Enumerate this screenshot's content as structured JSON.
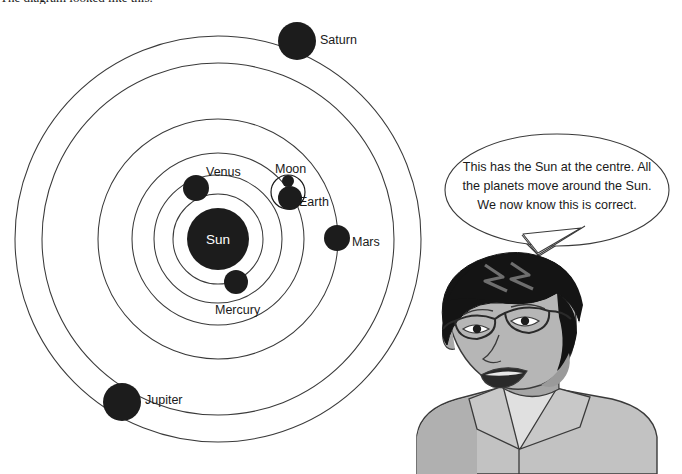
{
  "caption": {
    "text": "The diagram looked like this."
  },
  "diagram": {
    "name": "heliocentric-solar-system-diagram",
    "center_label": "Sun",
    "bodies": [
      {
        "name": "Sun",
        "label": "Sun",
        "cx": 218,
        "cy": 239,
        "r": 31,
        "label_x": 218,
        "label_y": 244,
        "label_anchor": "middle",
        "label_color": "#ffffff"
      },
      {
        "name": "Mercury",
        "label": "Mercury",
        "cx": 236,
        "cy": 282,
        "r": 12,
        "label_x": 215,
        "label_y": 314,
        "label_anchor": "start",
        "label_color": "#1a1a1a"
      },
      {
        "name": "Venus",
        "label": "Venus",
        "cx": 196,
        "cy": 188,
        "r": 13,
        "label_x": 206,
        "label_y": 176,
        "label_anchor": "start",
        "label_color": "#1a1a1a"
      },
      {
        "name": "Earth",
        "label": "Earth",
        "cx": 290,
        "cy": 198,
        "r": 12,
        "label_x": 299,
        "label_y": 206,
        "label_anchor": "start",
        "label_color": "#1a1a1a"
      },
      {
        "name": "Moon",
        "label": "Moon",
        "cx": 288,
        "cy": 181,
        "r": 6,
        "label_x": 275,
        "label_y": 173,
        "label_anchor": "start",
        "label_color": "#1a1a1a"
      },
      {
        "name": "Mars",
        "label": "Mars",
        "cx": 337,
        "cy": 238,
        "r": 13,
        "label_x": 352,
        "label_y": 246,
        "label_anchor": "start",
        "label_color": "#1a1a1a"
      },
      {
        "name": "Jupiter",
        "label": "Jupiter",
        "cx": 122,
        "cy": 402,
        "r": 19,
        "label_x": 145,
        "label_y": 404,
        "label_anchor": "start",
        "label_color": "#1a1a1a"
      },
      {
        "name": "Saturn",
        "label": "Saturn",
        "cx": 297,
        "cy": 41,
        "r": 19,
        "label_x": 320,
        "label_y": 44,
        "label_anchor": "start",
        "label_color": "#1a1a1a"
      }
    ],
    "orbits": [
      {
        "name": "mercury-orbit",
        "rx": 45,
        "ry": 45
      },
      {
        "name": "venus-orbit",
        "rx": 64,
        "ry": 64
      },
      {
        "name": "earth-orbit",
        "rx": 86,
        "ry": 86
      },
      {
        "name": "mars-orbit",
        "rx": 120,
        "ry": 120
      },
      {
        "name": "jupiter-orbit",
        "rx": 176,
        "ry": 176
      },
      {
        "name": "saturn-orbit",
        "rx": 203,
        "ry": 203
      }
    ],
    "moon_orbit": {
      "name": "moon-orbit",
      "cx": 288,
      "cy": 192,
      "r": 17
    },
    "orbit_center": {
      "cx": 218,
      "cy": 239
    },
    "colors": {
      "body_fill": "#1c1c1c",
      "orbit_stroke": "#3a3a3a",
      "background": "#ffffff"
    }
  },
  "speech": {
    "name": "speech-bubble",
    "text": "This has the Sun at the centre. All the planets move around the Sun. We now know this is correct."
  },
  "person": {
    "name": "person-illustration",
    "description": "Cartoon of a person with glasses speaking",
    "colors": {
      "hair": "#141414",
      "skin": "#b3b3b3",
      "skin_shadow": "#8f8f8f",
      "shirt": "#c2c2c2",
      "shirt_shadow": "#a8a8a8",
      "undershirt": "#dedede",
      "outline": "#3a3a3a"
    }
  }
}
